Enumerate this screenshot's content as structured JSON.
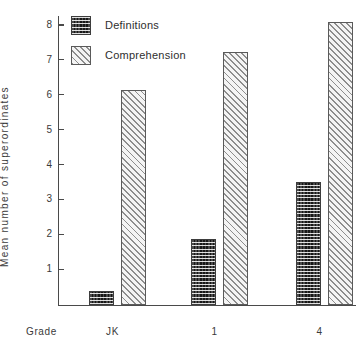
{
  "chart_data": {
    "type": "bar",
    "title": "",
    "xlabel": "Grade",
    "ylabel": "Mean number of superordinates",
    "categories": [
      "JK",
      "1",
      "4"
    ],
    "series": [
      {
        "name": "Definitions",
        "values": [
          0.4,
          1.88,
          3.52
        ]
      },
      {
        "name": "Comprehension",
        "values": [
          6.15,
          7.25,
          8.1
        ]
      }
    ],
    "ylim": [
      0,
      8
    ],
    "yticks": [
      1,
      2,
      3,
      4,
      5,
      6,
      7,
      8
    ],
    "ytick_labels": [
      "1",
      "2",
      "3",
      "4",
      "5",
      "6",
      "7",
      "8"
    ],
    "grid": false,
    "legend_position": "top-left",
    "colors": {
      "definitions": "#4a4a4a",
      "comprehension": "#f2f2f2",
      "axis": "#4a4a4a",
      "text": "#2b2b2b"
    }
  },
  "axis": {
    "y_label": "Mean number of superordinates",
    "x_label": "Grade",
    "ticks": [
      "8",
      "7",
      "6",
      "5",
      "4",
      "3",
      "2",
      "1"
    ]
  },
  "legend": {
    "items": [
      {
        "label": "Definitions",
        "pattern": "checkerboard-dark-swatch"
      },
      {
        "label": "Comprehension",
        "pattern": "diagonal-hatch-light-swatch"
      }
    ]
  },
  "xaxis": {
    "series_label": "Grade",
    "categories": [
      "JK",
      "1",
      "4"
    ]
  }
}
